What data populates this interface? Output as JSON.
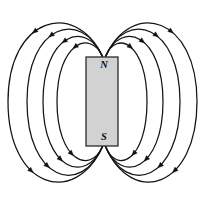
{
  "figure": {
    "background_color": "#ffffff",
    "width": 209,
    "height": 210
  },
  "magnet": {
    "label_north": "N",
    "label_south": "S",
    "fill_color": "#d2d2d2",
    "stroke_color": "#2b2b2b",
    "x": 86,
    "y": 57,
    "width": 32,
    "height": 89,
    "north_label_x": 104,
    "north_label_y": 66,
    "south_label_x": 104,
    "south_label_y": 138
  },
  "field": {
    "line_color": "#141414",
    "line_width": 1.25,
    "arrow_color": "#111111",
    "north_pole_point": {
      "x": 104,
      "y": 57
    },
    "south_pole_point": {
      "x": 104,
      "y": 146
    },
    "loop_count_per_side": 4,
    "direction_note": "out of N, around, into S",
    "left_loops_mid_x": [
      8,
      27,
      43,
      57
    ],
    "right_loops_mid_x": [
      147,
      163,
      180,
      197
    ]
  },
  "chart_data": {
    "type": "diagram",
    "subtitle": "",
    "xlabel": "",
    "ylabel": "",
    "loops": [
      {
        "side": "left",
        "index": 0,
        "extent_x": 57,
        "top_y": 37,
        "bottom_y": 167,
        "arrow_count": 2
      },
      {
        "side": "left",
        "index": 1,
        "extent_x": 43,
        "top_y": 27,
        "bottom_y": 177,
        "arrow_count": 2
      },
      {
        "side": "left",
        "index": 2,
        "extent_x": 27,
        "top_y": 16,
        "bottom_y": 189,
        "arrow_count": 2
      },
      {
        "side": "left",
        "index": 3,
        "extent_x": 8,
        "top_y": 7,
        "bottom_y": 199,
        "arrow_count": 2
      },
      {
        "side": "right",
        "index": 0,
        "extent_x": 147,
        "top_y": 37,
        "bottom_y": 167,
        "arrow_count": 2
      },
      {
        "side": "right",
        "index": 1,
        "extent_x": 163,
        "top_y": 27,
        "bottom_y": 177,
        "arrow_count": 2
      },
      {
        "side": "right",
        "index": 2,
        "extent_x": 180,
        "top_y": 16,
        "bottom_y": 189,
        "arrow_count": 2
      },
      {
        "side": "right",
        "index": 3,
        "extent_x": 197,
        "top_y": 7,
        "bottom_y": 199,
        "arrow_count": 2
      }
    ],
    "legend": [],
    "annotations": [
      {
        "text": "N",
        "x": 104,
        "y": 66
      },
      {
        "text": "S",
        "x": 104,
        "y": 138
      }
    ]
  }
}
